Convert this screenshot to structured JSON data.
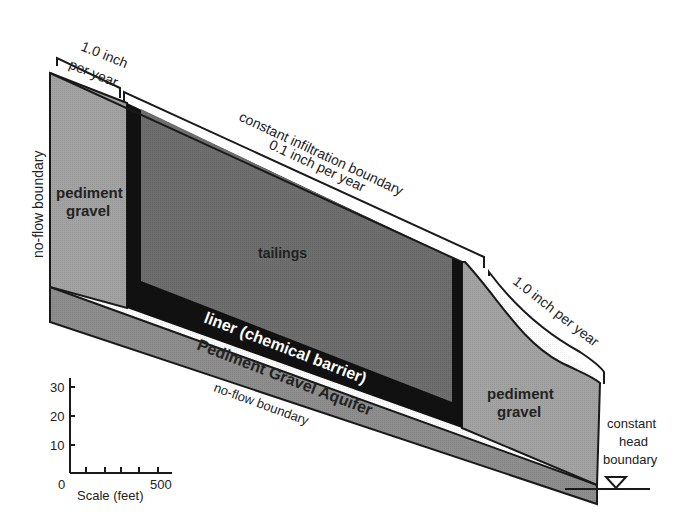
{
  "diagram": {
    "type": "cross-section",
    "labels": {
      "left_infiltration_line1": "1.0 inch",
      "left_infiltration_line2": "per year",
      "top_boundary_line1": "constant infiltration boundary",
      "top_boundary_line2": "0.1 inch per year",
      "right_infiltration": "1.0 inch per year",
      "left_side_boundary": "no-flow boundary",
      "left_gravel_line1": "pediment",
      "left_gravel_line2": "gravel",
      "tailings": "tailings",
      "liner": "liner (chemical barrier)",
      "aquifer": "Pediment Gravel Aquifer",
      "bottom_boundary": "no-flow boundary",
      "right_gravel_line1": "pediment",
      "right_gravel_line2": "gravel",
      "right_boundary_line1": "constant",
      "right_boundary_line2": "head",
      "right_boundary_line3": "boundary"
    },
    "scale": {
      "title": "Scale (feet)",
      "x_min_label": "0",
      "x_max_label": "500",
      "y_ticks": [
        "10",
        "20",
        "30"
      ]
    },
    "colors": {
      "pediment_gravel": "#a3a3a3",
      "tailings": "#6e6e6e",
      "liner": "#111111",
      "aquifer": "#8e8e8e",
      "outline": "#1a1a1a"
    }
  }
}
